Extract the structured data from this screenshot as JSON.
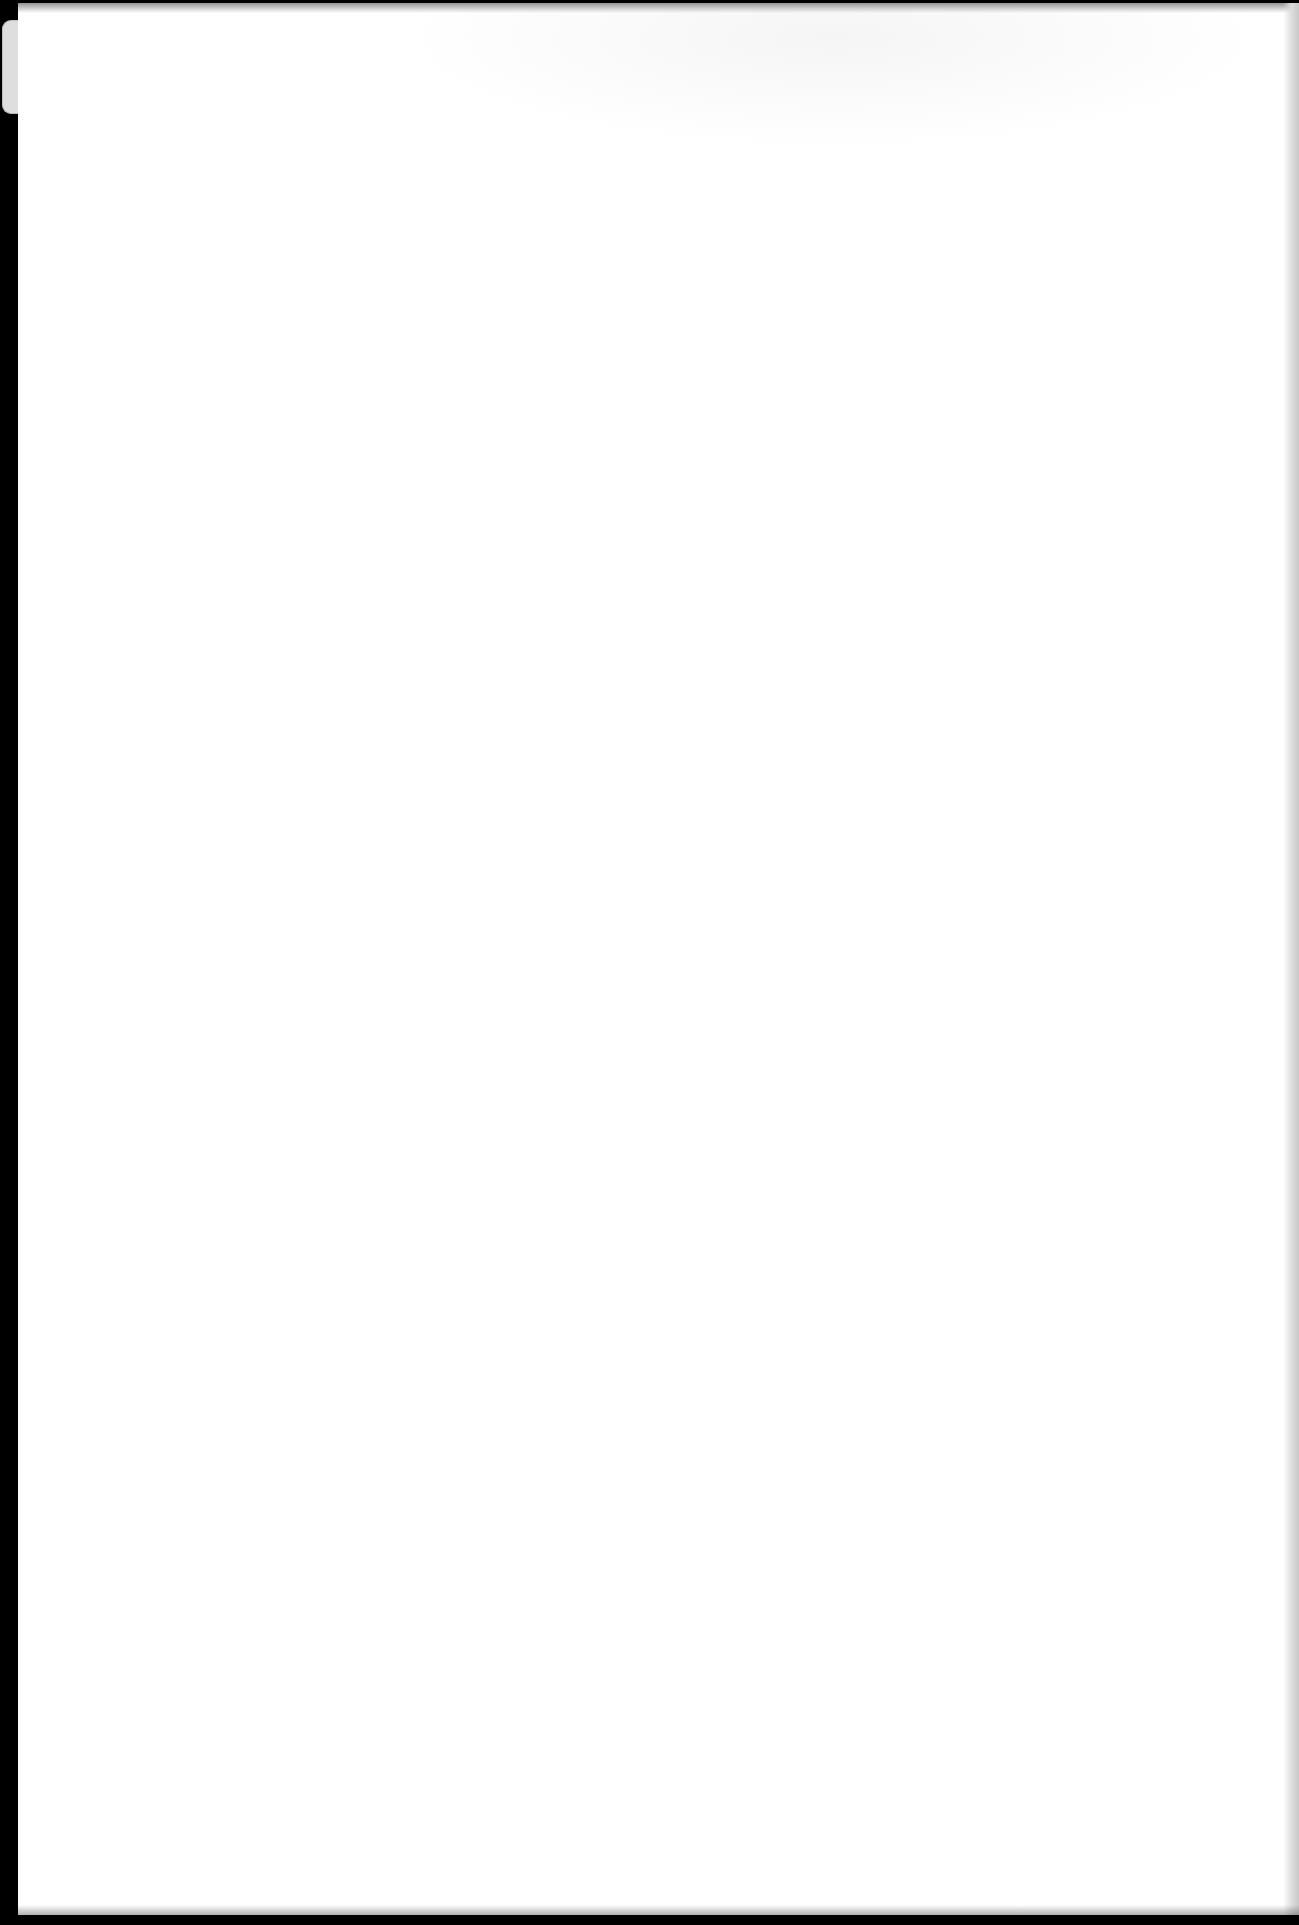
{
  "document": {
    "type": "scanned-page",
    "content_text": "",
    "is_blank": true
  },
  "colors": {
    "scanner_background": "#000000",
    "paper": "#ffffff",
    "edge_shadow": "#c8c8c8",
    "tab": "#dedede"
  }
}
